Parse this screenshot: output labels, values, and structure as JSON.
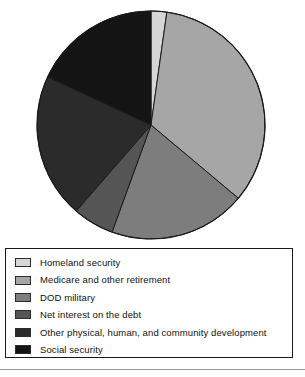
{
  "chart_data": {
    "type": "pie",
    "title": "",
    "legend_position": "bottom",
    "center": {
      "cx": 151,
      "cy": 125,
      "r": 114
    },
    "start_angle_deg": 0,
    "direction": "clockwise",
    "categories": [
      "Homeland security",
      "Medicare and other retirement",
      "DOD military",
      "Net interest on the debt",
      "Other physical, human, and community development",
      "Social security"
    ],
    "values": [
      2,
      34,
      19,
      6,
      21,
      18
    ],
    "unit": "percent",
    "colors": [
      "#d6d6d6",
      "#a6a6a6",
      "#7d7d7d",
      "#555555",
      "#2b2b2b",
      "#141414"
    ],
    "slices": [
      {
        "label": "Homeland security",
        "value": 2,
        "start_deg": 0,
        "end_deg": 8,
        "color": "#d6d6d6"
      },
      {
        "label": "Medicare and other retirement",
        "value": 34,
        "start_deg": 8,
        "end_deg": 130,
        "color": "#a6a6a6"
      },
      {
        "label": "DOD military",
        "value": 19,
        "start_deg": 130,
        "end_deg": 200,
        "color": "#7d7d7d"
      },
      {
        "label": "Net interest on the debt",
        "value": 6,
        "start_deg": 200,
        "end_deg": 221,
        "color": "#555555"
      },
      {
        "label": "Other physical, human, and community development",
        "value": 21,
        "start_deg": 221,
        "end_deg": 295,
        "color": "#2b2b2b"
      },
      {
        "label": "Social security",
        "value": 18,
        "start_deg": 295,
        "end_deg": 360,
        "color": "#141414"
      }
    ]
  },
  "legend": {
    "items": [
      {
        "label": "Homeland security",
        "color": "#d6d6d6"
      },
      {
        "label": "Medicare and other retirement",
        "color": "#a6a6a6"
      },
      {
        "label": "DOD military",
        "color": "#7d7d7d"
      },
      {
        "label": "Net interest on the debt",
        "color": "#555555"
      },
      {
        "label": "Other physical, human, and community development",
        "color": "#2b2b2b"
      },
      {
        "label": "Social security",
        "color": "#141414"
      }
    ]
  }
}
